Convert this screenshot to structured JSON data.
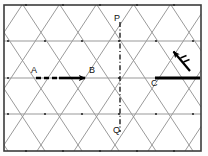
{
  "figure": {
    "background_color": "#fdfdfd",
    "border_color": "#3b3b3b",
    "lattice_color": "#8a8a8a",
    "gridline_color": "#9a9a9a",
    "vector_color": "#000000",
    "frame": {
      "x": 4,
      "y": 5,
      "width": 197,
      "height": 146
    },
    "horizontal_gridlines_y": [
      5,
      41,
      78,
      114,
      151
    ],
    "lattice_period_x": 37,
    "lattice_half_period_x": 18.5
  },
  "labels": {
    "point_a": "A",
    "point_b": "B",
    "point_c": "C",
    "point_p": "P",
    "point_q": "Q"
  },
  "vectors": {
    "ab": {
      "label": "A to B",
      "x1": 36,
      "y1": 78,
      "x2": 88,
      "y2": 78,
      "style": "bold-dashed-then-solid",
      "arrowhead": "right"
    },
    "c_right": {
      "label": "C to right edge",
      "x1": 155,
      "y1": 78,
      "x2": 200,
      "y2": 78,
      "style": "bold-solid",
      "arrowhead": "right"
    },
    "diagonal": {
      "label": "diagonal up-left vector",
      "x1": 190,
      "y1": 70,
      "x2": 172,
      "y2": 50,
      "style": "bold-solid",
      "arrowhead": "up-left",
      "tick_marks": 2
    },
    "pq": {
      "label": "P to Q",
      "x1": 120,
      "y1": 22,
      "x2": 120,
      "y2": 132,
      "style": "dash-dot",
      "arrowhead": "none"
    }
  },
  "label_positions": {
    "point_a": {
      "x": 31,
      "y": 68
    },
    "point_b": {
      "x": 89,
      "y": 68
    },
    "point_c": {
      "x": 152,
      "y": 79
    },
    "point_p": {
      "x": 115,
      "y": 15
    },
    "point_q": {
      "x": 114,
      "y": 126
    }
  }
}
